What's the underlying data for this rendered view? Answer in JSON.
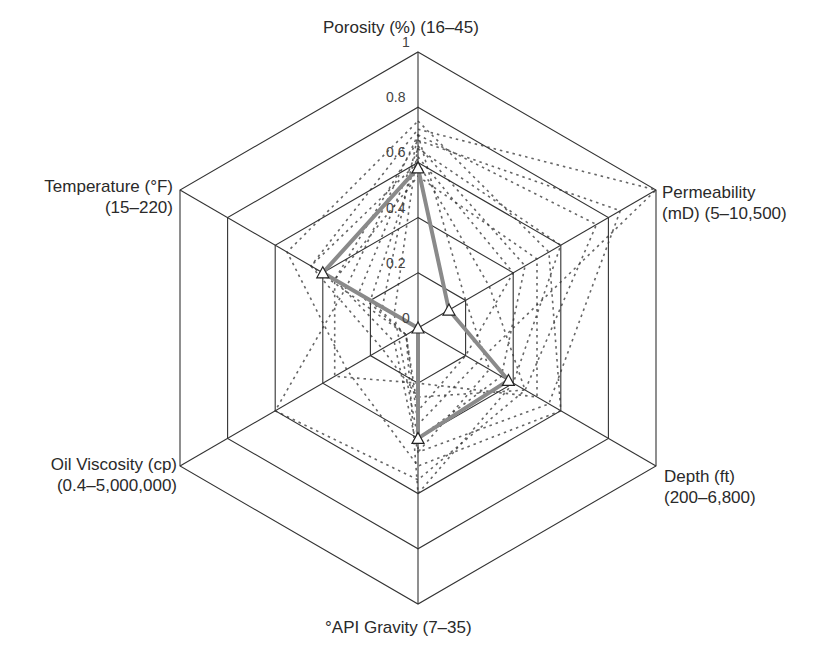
{
  "chart_data": {
    "type": "radar",
    "title": "",
    "axes": [
      {
        "name": "Porosity (%)",
        "range": "(16–45)"
      },
      {
        "name": "Permeability",
        "range": "(mD) (5–10,500)"
      },
      {
        "name": "Depth (ft)",
        "range": "(200–6,800)"
      },
      {
        "name": "°API Gravity",
        "range": "(7–35)"
      },
      {
        "name": "Oil Viscosity (cp)",
        "range": "(0.4–5,000,000)"
      },
      {
        "name": "Temperature (°F)",
        "range": "(15–220)"
      }
    ],
    "radial_ticks": [
      "0",
      "0.2",
      "0.4",
      "0.6",
      "0.8",
      "1"
    ],
    "rlim": [
      0,
      1
    ],
    "grid": true,
    "series": [
      {
        "name": "highlighted",
        "style": "solid-grey-triangles",
        "values": [
          0.58,
          0.13,
          0.38,
          0.4,
          0.0,
          0.4
        ]
      },
      {
        "name": "s1",
        "style": "dotted",
        "values": [
          0.72,
          1.0,
          0.25,
          0.35,
          0.05,
          0.45
        ]
      },
      {
        "name": "s2",
        "style": "dotted",
        "values": [
          0.7,
          0.75,
          0.45,
          0.55,
          0.6,
          0.3
        ]
      },
      {
        "name": "s3",
        "style": "dotted",
        "values": [
          0.68,
          0.85,
          0.55,
          0.45,
          0.1,
          0.35
        ]
      },
      {
        "name": "s4",
        "style": "dotted",
        "values": [
          0.65,
          0.6,
          0.4,
          0.6,
          0.05,
          0.25
        ]
      },
      {
        "name": "s5",
        "style": "dotted",
        "values": [
          0.75,
          0.55,
          0.6,
          0.5,
          0.3,
          0.55
        ]
      },
      {
        "name": "s6",
        "style": "dotted",
        "values": [
          0.62,
          0.4,
          0.2,
          0.3,
          0.05,
          0.2
        ]
      },
      {
        "name": "s7",
        "style": "dotted",
        "values": [
          0.6,
          0.3,
          0.45,
          0.25,
          0.15,
          0.45
        ]
      },
      {
        "name": "s8",
        "style": "dotted",
        "values": [
          0.7,
          0.2,
          0.3,
          0.45,
          0.0,
          0.15
        ]
      },
      {
        "name": "s9",
        "style": "dotted",
        "values": [
          0.55,
          0.5,
          0.5,
          0.2,
          0.35,
          0.35
        ]
      },
      {
        "name": "s10",
        "style": "dotted",
        "values": [
          0.66,
          0.45,
          0.35,
          0.4,
          0.08,
          0.1
        ]
      }
    ],
    "colors": {
      "grid": "#333333",
      "highlight": "#8a8a8a",
      "dotted": "#333333"
    }
  }
}
